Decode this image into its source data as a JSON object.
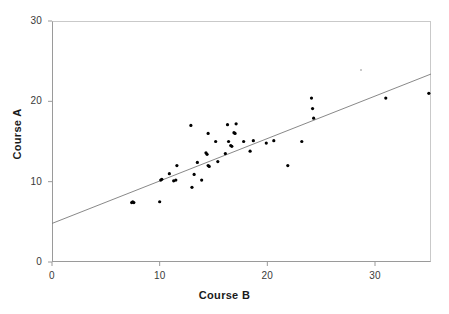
{
  "chart_data": {
    "type": "scatter",
    "title": "",
    "xlabel": "Course B",
    "ylabel": "Course A",
    "xlim": [
      0,
      35.2
    ],
    "ylim": [
      0,
      30
    ],
    "xticks": [
      0,
      10,
      20,
      30
    ],
    "yticks": [
      0,
      10,
      20,
      30
    ],
    "xtick_labels": [
      "0",
      "10",
      "20",
      "30"
    ],
    "ytick_labels": [
      "0",
      "10",
      "20",
      "30"
    ],
    "grid": false,
    "legend": "none",
    "points": [
      {
        "x": 7.4,
        "y": 7.4
      },
      {
        "x": 7.5,
        "y": 7.5
      },
      {
        "x": 7.6,
        "y": 7.4
      },
      {
        "x": 10.0,
        "y": 7.5
      },
      {
        "x": 10.1,
        "y": 10.2
      },
      {
        "x": 10.2,
        "y": 10.3
      },
      {
        "x": 10.9,
        "y": 11.0
      },
      {
        "x": 11.3,
        "y": 10.1
      },
      {
        "x": 11.5,
        "y": 10.2
      },
      {
        "x": 11.6,
        "y": 12.0
      },
      {
        "x": 12.9,
        "y": 17.0
      },
      {
        "x": 13.0,
        "y": 9.3
      },
      {
        "x": 13.2,
        "y": 10.9
      },
      {
        "x": 13.5,
        "y": 12.4
      },
      {
        "x": 13.9,
        "y": 10.2
      },
      {
        "x": 14.3,
        "y": 13.6
      },
      {
        "x": 14.4,
        "y": 13.4
      },
      {
        "x": 14.5,
        "y": 16.0
      },
      {
        "x": 14.5,
        "y": 12.0
      },
      {
        "x": 14.6,
        "y": 11.9
      },
      {
        "x": 15.2,
        "y": 15.0
      },
      {
        "x": 15.4,
        "y": 12.5
      },
      {
        "x": 16.1,
        "y": 13.5
      },
      {
        "x": 16.3,
        "y": 17.1
      },
      {
        "x": 16.4,
        "y": 15.0
      },
      {
        "x": 16.6,
        "y": 14.5
      },
      {
        "x": 16.7,
        "y": 14.4
      },
      {
        "x": 16.9,
        "y": 16.1
      },
      {
        "x": 17.0,
        "y": 16.0
      },
      {
        "x": 17.1,
        "y": 17.2
      },
      {
        "x": 17.8,
        "y": 15.0
      },
      {
        "x": 18.4,
        "y": 13.8
      },
      {
        "x": 18.7,
        "y": 15.1
      },
      {
        "x": 19.9,
        "y": 14.8
      },
      {
        "x": 20.6,
        "y": 15.1
      },
      {
        "x": 21.9,
        "y": 12.0
      },
      {
        "x": 23.2,
        "y": 15.0
      },
      {
        "x": 24.1,
        "y": 20.4
      },
      {
        "x": 24.2,
        "y": 19.1
      },
      {
        "x": 24.3,
        "y": 17.9
      },
      {
        "x": 28.7,
        "y": 23.9
      },
      {
        "x": 31.0,
        "y": 20.4
      },
      {
        "x": 35.0,
        "y": 21.0
      }
    ],
    "trendline": {
      "x_start": 0.0,
      "y_start": 4.8,
      "x_end": 35.2,
      "y_end": 23.4
    }
  }
}
